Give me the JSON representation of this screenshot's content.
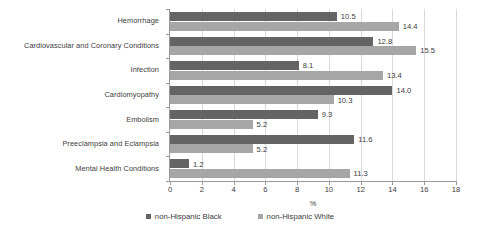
{
  "chart_data": {
    "type": "bar",
    "orientation": "horizontal",
    "title": "",
    "xlabel": "%",
    "ylabel": "",
    "xlim": [
      0,
      18
    ],
    "xticks": [
      0,
      2,
      4,
      6,
      8,
      10,
      12,
      14,
      16,
      18
    ],
    "grid": true,
    "legend_position": "bottom",
    "categories": [
      "Hemorrhage",
      "Cardiovascular and Coronary Conditions",
      "Infection",
      "Cardiomyopathy",
      "Embolism",
      "Preeclampsia and Eclampsia",
      "Mental Health Conditions"
    ],
    "series": [
      {
        "name": "non-Hispanic Black",
        "color": "#646464",
        "values": [
          10.5,
          12.8,
          8.1,
          14.0,
          9.3,
          11.6,
          1.2
        ],
        "labels": [
          "10.5",
          "12.8",
          "8.1",
          "14.0",
          "9.3",
          "11.6",
          "1.2"
        ]
      },
      {
        "name": "non-Hispanic White",
        "color": "#a6a6a6",
        "values": [
          14.4,
          15.5,
          13.4,
          10.3,
          5.2,
          5.2,
          11.3
        ],
        "labels": [
          "14.4",
          "15.5",
          "13.4",
          "10.3",
          "5.2",
          "5.2",
          "11.3"
        ]
      }
    ]
  },
  "axis": {
    "tick_labels": [
      "0",
      "2",
      "4",
      "6",
      "8",
      "10",
      "12",
      "14",
      "16",
      "18"
    ],
    "x_title": "%"
  },
  "legend": {
    "items": [
      {
        "label": "non-Hispanic Black",
        "color": "#646464"
      },
      {
        "label": "non-Hispanic White",
        "color": "#a6a6a6"
      }
    ]
  }
}
